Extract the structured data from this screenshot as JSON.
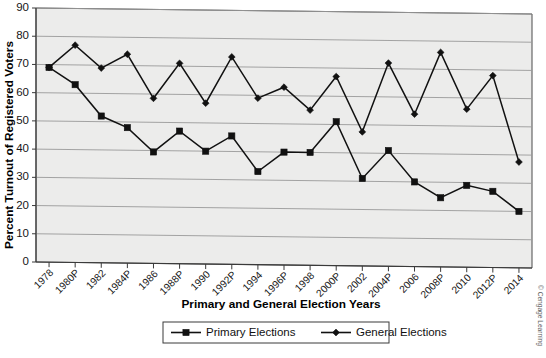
{
  "chart_data": {
    "type": "line",
    "title": "",
    "xlabel": "Primary and General Election Years",
    "ylabel": "Percent Turnout of Registered Voters",
    "ylim": [
      0,
      90
    ],
    "ytick_step": 10,
    "yticks": [
      0,
      10,
      20,
      30,
      40,
      50,
      60,
      70,
      80,
      90
    ],
    "grid": true,
    "legend_position": "bottom",
    "categories": [
      "1978",
      "1980P",
      "1982",
      "1984P",
      "1986",
      "1988P",
      "1990",
      "1992P",
      "1994",
      "1996P",
      "1998",
      "2000P",
      "2002",
      "2004P",
      "2006",
      "2008P",
      "2010",
      "2012P",
      "2014"
    ],
    "series": [
      {
        "name": "Primary Elections",
        "marker": "square",
        "color": "#111111",
        "values": [
          69,
          63,
          52,
          48,
          39.5,
          47,
          40,
          45.5,
          33,
          40,
          40,
          51,
          31,
          41,
          30,
          24.5,
          29,
          27,
          20
        ]
      },
      {
        "name": "General Elections",
        "marker": "diamond",
        "color": "#111111",
        "values": [
          69,
          77,
          69,
          74,
          58.5,
          71,
          57,
          73.5,
          59,
          63,
          55,
          67,
          47.5,
          72,
          54,
          76,
          56,
          68,
          37.5
        ]
      }
    ]
  },
  "axes": {
    "y_title": "Percent Turnout of Registered Voters",
    "x_title": "Primary and General Election Years"
  },
  "legend": {
    "items": [
      {
        "label": "Primary Elections",
        "marker": "square"
      },
      {
        "label": "General Elections",
        "marker": "diamond"
      }
    ]
  },
  "credit": {
    "text": "© Cengage Learning"
  }
}
